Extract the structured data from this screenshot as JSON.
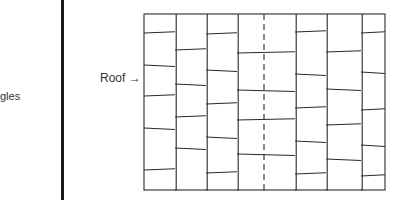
{
  "caption": {
    "fragment": "gles"
  },
  "figure": {
    "label": "Roof",
    "arrow": "→",
    "frame": {
      "x": 144,
      "y": 14,
      "w": 241,
      "h": 176
    },
    "stroke_color": "#2a2a2a",
    "center_dashed_x": 264,
    "columns": [
      {
        "x1": 144,
        "x2": 175,
        "rows": [
          33,
          65,
          96,
          128,
          170
        ]
      },
      {
        "x1": 175,
        "x2": 206,
        "rows": [
          50,
          84,
          117,
          148
        ]
      },
      {
        "x1": 206,
        "x2": 237,
        "rows": [
          34,
          70,
          104,
          137,
          173
        ]
      },
      {
        "x1": 237,
        "x2": 295,
        "rows": [
          53,
          90,
          120,
          154
        ]
      },
      {
        "x1": 295,
        "x2": 326,
        "rows": [
          32,
          74,
          108,
          141,
          174
        ]
      },
      {
        "x1": 326,
        "x2": 361,
        "rows": [
          52,
          89,
          125,
          159
        ]
      },
      {
        "x1": 361,
        "x2": 385,
        "rows": [
          33,
          72,
          110,
          145,
          176
        ]
      }
    ]
  }
}
